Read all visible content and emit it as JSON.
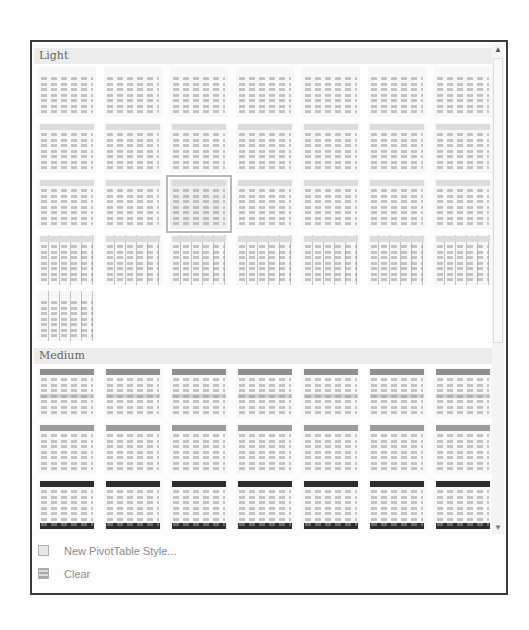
{
  "gallery": {
    "sections": [
      {
        "label": "Light",
        "rows": 5,
        "count": 29
      },
      {
        "label": "Medium",
        "rows": 3,
        "count": 21
      }
    ],
    "selected": {
      "section": "Light",
      "row": 3,
      "column": 3
    }
  },
  "menu": {
    "items": [
      {
        "label": "New PivotTable Style...",
        "icon": "new-style-icon"
      },
      {
        "label": "Clear",
        "icon": "clear-icon"
      }
    ]
  },
  "scrollbar": {
    "up_icon": "▲",
    "down_icon": "▼"
  }
}
